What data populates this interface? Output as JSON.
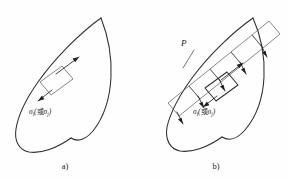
{
  "figure": {
    "background_color": "#fefefe",
    "line_color": "#2e2e2e",
    "panels": [
      {
        "id": "a",
        "caption": "a)",
        "labels": {
          "sigma_main": "σ",
          "sigma_main_sub": "i",
          "paren_open": "(",
          "conjunction": "或",
          "sigma_alt": "σ",
          "sigma_alt_sub": "j",
          "paren_close": ")"
        },
        "element_names": {
          "boundary": "lens-boundary",
          "cell": "parallelogram-cell",
          "arrow_up": "normal-arrow-outward",
          "arrow_down": "normal-arrow-inward"
        }
      },
      {
        "id": "b",
        "caption": "b)",
        "labels": {
          "plane_label": "P",
          "sigma_main": "σ",
          "sigma_main_sub": "i",
          "paren_open": "(",
          "conjunction": "或",
          "sigma_alt": "σ",
          "sigma_alt_sub": "j",
          "paren_close": ")"
        },
        "element_names": {
          "boundary": "lens-boundary",
          "cell_strip": "parallelogram-cell-strip",
          "cell": "parallelogram-cell",
          "arrow": "projection-arrow"
        }
      }
    ]
  }
}
